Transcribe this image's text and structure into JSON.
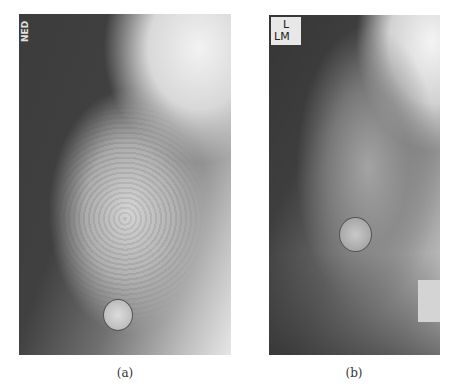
{
  "figure": {
    "panels": [
      {
        "id": "a",
        "caption": "(a)",
        "side_text": "NED",
        "marker": "circular skin marker"
      },
      {
        "id": "b",
        "caption": "(b)",
        "label_lines": [
          "L",
          "LM"
        ],
        "marker": "circular skin marker"
      }
    ]
  }
}
